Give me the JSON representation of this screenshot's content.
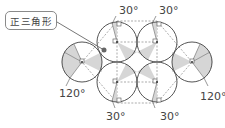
{
  "callout": {
    "text": "正三角形"
  },
  "labels": {
    "top_left": "30°",
    "top_right": "30°",
    "bottom_left": "30°",
    "bottom_right": "30°",
    "left": "120°",
    "right": "120°"
  },
  "colors": {
    "stroke": "#555555",
    "shade": "#d6d6d6",
    "dashed": "#888888",
    "text": "#444444"
  }
}
